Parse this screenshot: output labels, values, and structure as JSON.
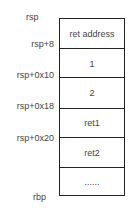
{
  "labels": {
    "rsp": "rsp",
    "rsp_8": "rsp+8",
    "rsp_0x10": "rsp+0x10",
    "rsp_0x18": "rsp+0x18",
    "rsp_0x20": "rsp+0x20",
    "rbp": "rbp"
  },
  "stack": {
    "cells": [
      "ret address",
      "1",
      "2",
      "ret1",
      "ret2",
      "......"
    ]
  }
}
